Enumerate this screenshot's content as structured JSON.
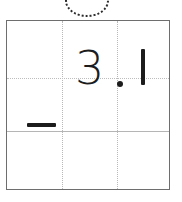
{
  "worksheet": {
    "title": "Arithmetic practice grid",
    "type": "vertical-subtraction-grid",
    "grid": {
      "rows": 3,
      "columns": 4,
      "column_separator_style": "dotted",
      "row_separator_styles": [
        "dotted",
        "solid"
      ],
      "border_color": "#6e6e6e",
      "guide_color": "#bdbdbd",
      "background": "#ffffff"
    },
    "annotation": {
      "name": "dotted-circle-marker",
      "shape": "circle",
      "stroke_style": "dotted",
      "color": "#2b2b2b",
      "clipped": "top"
    },
    "entries": [
      {
        "row": 1,
        "column": 2,
        "name": "digit-three",
        "value": "3"
      },
      {
        "row": 1,
        "column": 2,
        "name": "decimal-point",
        "value": "."
      },
      {
        "row": 1,
        "column": 3,
        "name": "digit-one",
        "value": "1"
      },
      {
        "row": 2,
        "column": 1,
        "name": "minus-operator",
        "value": "−"
      }
    ],
    "expression": "3.1",
    "operator": "−",
    "ink_color": "#1c1c1c"
  }
}
